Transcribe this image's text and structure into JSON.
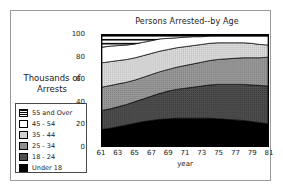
{
  "chart_data": {
    "type": "area",
    "title": "Persons Arrested--by Age",
    "xlabel": "year",
    "ylabel": "Thousands of Arrests",
    "xlim": [
      61,
      81
    ],
    "ylim": [
      0,
      100
    ],
    "grid": false,
    "legend_position": "left",
    "stacked": true,
    "x": [
      61,
      62,
      63,
      64,
      65,
      66,
      67,
      68,
      69,
      70,
      71,
      72,
      73,
      74,
      75,
      76,
      77,
      78,
      79,
      80,
      81
    ],
    "xticks": [
      "61",
      "63",
      "65",
      "67",
      "69",
      "71",
      "73",
      "75",
      "77",
      "79",
      "81"
    ],
    "yticks": [
      "0",
      "20",
      "40",
      "60",
      "80",
      "100"
    ],
    "series": [
      {
        "name": "Under 18",
        "color": "#000000",
        "pattern": "solid-black",
        "values": [
          15,
          16,
          17.5,
          19,
          20.5,
          22,
          23,
          24,
          24.5,
          25,
          25,
          25,
          25,
          25,
          24.5,
          24,
          23.5,
          23,
          22,
          21,
          20
        ]
      },
      {
        "name": "18 - 24",
        "color": "#4d4d4d",
        "pattern": "dark-gray",
        "values": [
          17,
          17.5,
          18,
          18.5,
          19.5,
          20.5,
          22,
          23.5,
          25,
          26,
          27,
          28,
          29,
          30,
          31,
          31.5,
          32,
          32.5,
          33,
          33.5,
          34
        ]
      },
      {
        "name": "25 - 34",
        "color": "#8e8e8e",
        "pattern": "medium-gray",
        "values": [
          21,
          21,
          20.5,
          20,
          19.5,
          19.5,
          19.5,
          19.5,
          19.5,
          20,
          20.5,
          21,
          21.5,
          22,
          22.5,
          23,
          23.5,
          24,
          24.5,
          25,
          26
        ]
      },
      {
        "name": "35 - 44",
        "color": "#d2d2d2",
        "pattern": "light-dotted",
        "values": [
          22,
          21.5,
          21,
          20.5,
          20,
          19.5,
          19,
          18.5,
          18,
          17.5,
          17,
          16.5,
          16,
          15.5,
          15,
          14.5,
          14,
          13.5,
          13,
          12,
          11
        ]
      },
      {
        "name": "45 - 54",
        "color": "#ffffff",
        "pattern": "white",
        "values": [
          14,
          14,
          13.5,
          13,
          12.5,
          12,
          11.5,
          11,
          10,
          9,
          8.5,
          8,
          7,
          6.5,
          6,
          6,
          6,
          6,
          6.5,
          7.5,
          8
        ]
      },
      {
        "name": "55 and Over",
        "color": "#000000",
        "pattern": "horizontal-stripes",
        "values": [
          11,
          10,
          9.5,
          9,
          8,
          6.5,
          5,
          3.5,
          3,
          2.5,
          2,
          1.5,
          1.5,
          1,
          1,
          1,
          1,
          1,
          1,
          1,
          1
        ]
      }
    ]
  },
  "legend": {
    "heading_line1": "Thousands of",
    "heading_line2": "Arrests",
    "items": [
      {
        "label": "55 and Over",
        "pattern": "horizontal-stripes"
      },
      {
        "label": "45 - 54",
        "pattern": "white"
      },
      {
        "label": "35 - 44",
        "pattern": "light-dotted"
      },
      {
        "label": "25 - 34",
        "pattern": "medium-gray"
      },
      {
        "label": "18 - 24",
        "pattern": "dark-gray"
      },
      {
        "label": "Under 18",
        "pattern": "solid-black"
      }
    ]
  }
}
